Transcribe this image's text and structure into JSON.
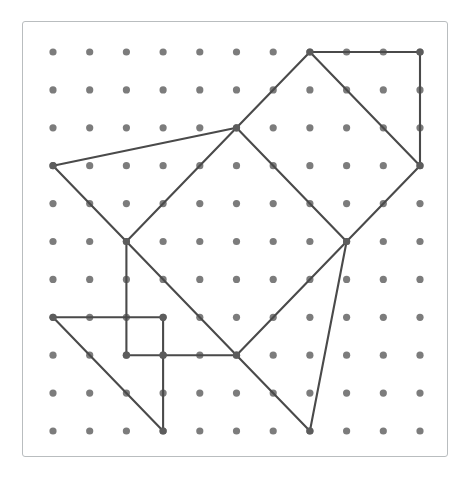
{
  "figure": {
    "kind": "dot-paper-polygon-diagram",
    "canvas": {
      "width": 471,
      "height": 488,
      "background": "#ffffff"
    },
    "board": {
      "left": 22,
      "top": 21,
      "width": 426,
      "height": 436,
      "border_color": "#b9bdbf",
      "fill": "#ffffff",
      "corner_radius": 3
    }
  },
  "grid": {
    "columns": 11,
    "rows": 11,
    "origin_x": 53,
    "origin_y": 52,
    "step_x": 36.7,
    "step_y": 37.9,
    "dot_radius": 3.6,
    "dot_color": "#7c7c7c"
  },
  "line_style": {
    "color": "#4a4a4a",
    "width": 2.1
  },
  "chart_data": {
    "type": "scatter",
    "xlabel": "",
    "ylabel": "",
    "xlim": [
      0,
      10
    ],
    "ylim": [
      0,
      10
    ],
    "grid": false,
    "legend": "none",
    "note": "Grid coordinates are (column, row) with column 0 at left and row 0 at top.",
    "segments": [
      {
        "name": "top-edge",
        "from": [
          7,
          0
        ],
        "to": [
          10,
          0
        ]
      },
      {
        "name": "right-edge-upper",
        "from": [
          10,
          0
        ],
        "to": [
          10,
          3
        ]
      },
      {
        "name": "square-top-right-side",
        "from": [
          7,
          0
        ],
        "to": [
          10,
          3
        ]
      },
      {
        "name": "square-top-left-side",
        "from": [
          5,
          2
        ],
        "to": [
          7,
          0
        ]
      },
      {
        "name": "square-upper-diagonal",
        "from": [
          5,
          2
        ],
        "to": [
          8,
          5
        ]
      },
      {
        "name": "square-right-lower-side",
        "from": [
          10,
          3
        ],
        "to": [
          8,
          5
        ]
      },
      {
        "name": "long-left-upper",
        "from": [
          0,
          3
        ],
        "to": [
          5,
          2
        ]
      },
      {
        "name": "left-lower",
        "from": [
          0,
          3
        ],
        "to": [
          2,
          5
        ]
      },
      {
        "name": "square-left-side",
        "from": [
          2,
          5
        ],
        "to": [
          5,
          2
        ]
      },
      {
        "name": "square-bottom-left-side",
        "from": [
          2,
          5
        ],
        "to": [
          5,
          8
        ]
      },
      {
        "name": "square-bottom-right-side",
        "from": [
          5,
          8
        ],
        "to": [
          8,
          5
        ]
      },
      {
        "name": "tail-right",
        "from": [
          8,
          5
        ],
        "to": [
          7,
          10
        ]
      },
      {
        "name": "tail-left",
        "from": [
          5,
          8
        ],
        "to": [
          7,
          10
        ]
      },
      {
        "name": "stem-vertical",
        "from": [
          2,
          5
        ],
        "to": [
          2,
          8
        ]
      },
      {
        "name": "row7-horizontal",
        "from": [
          0,
          7
        ],
        "to": [
          3,
          7
        ]
      },
      {
        "name": "inner-vertical-upper",
        "from": [
          3,
          7
        ],
        "to": [
          3,
          8
        ]
      },
      {
        "name": "row8-horizontal",
        "from": [
          2,
          8
        ],
        "to": [
          5,
          8
        ]
      },
      {
        "name": "inner-vertical-lower",
        "from": [
          3,
          8
        ],
        "to": [
          3,
          10
        ]
      },
      {
        "name": "lower-left-diagonal",
        "from": [
          0,
          7
        ],
        "to": [
          3,
          10
        ]
      }
    ],
    "vertices": [
      [
        7,
        0
      ],
      [
        10,
        0
      ],
      [
        10,
        3
      ],
      [
        5,
        2
      ],
      [
        8,
        5
      ],
      [
        0,
        3
      ],
      [
        2,
        5
      ],
      [
        5,
        8
      ],
      [
        7,
        10
      ],
      [
        2,
        8
      ],
      [
        0,
        7
      ],
      [
        3,
        7
      ],
      [
        3,
        8
      ],
      [
        3,
        10
      ]
    ]
  }
}
